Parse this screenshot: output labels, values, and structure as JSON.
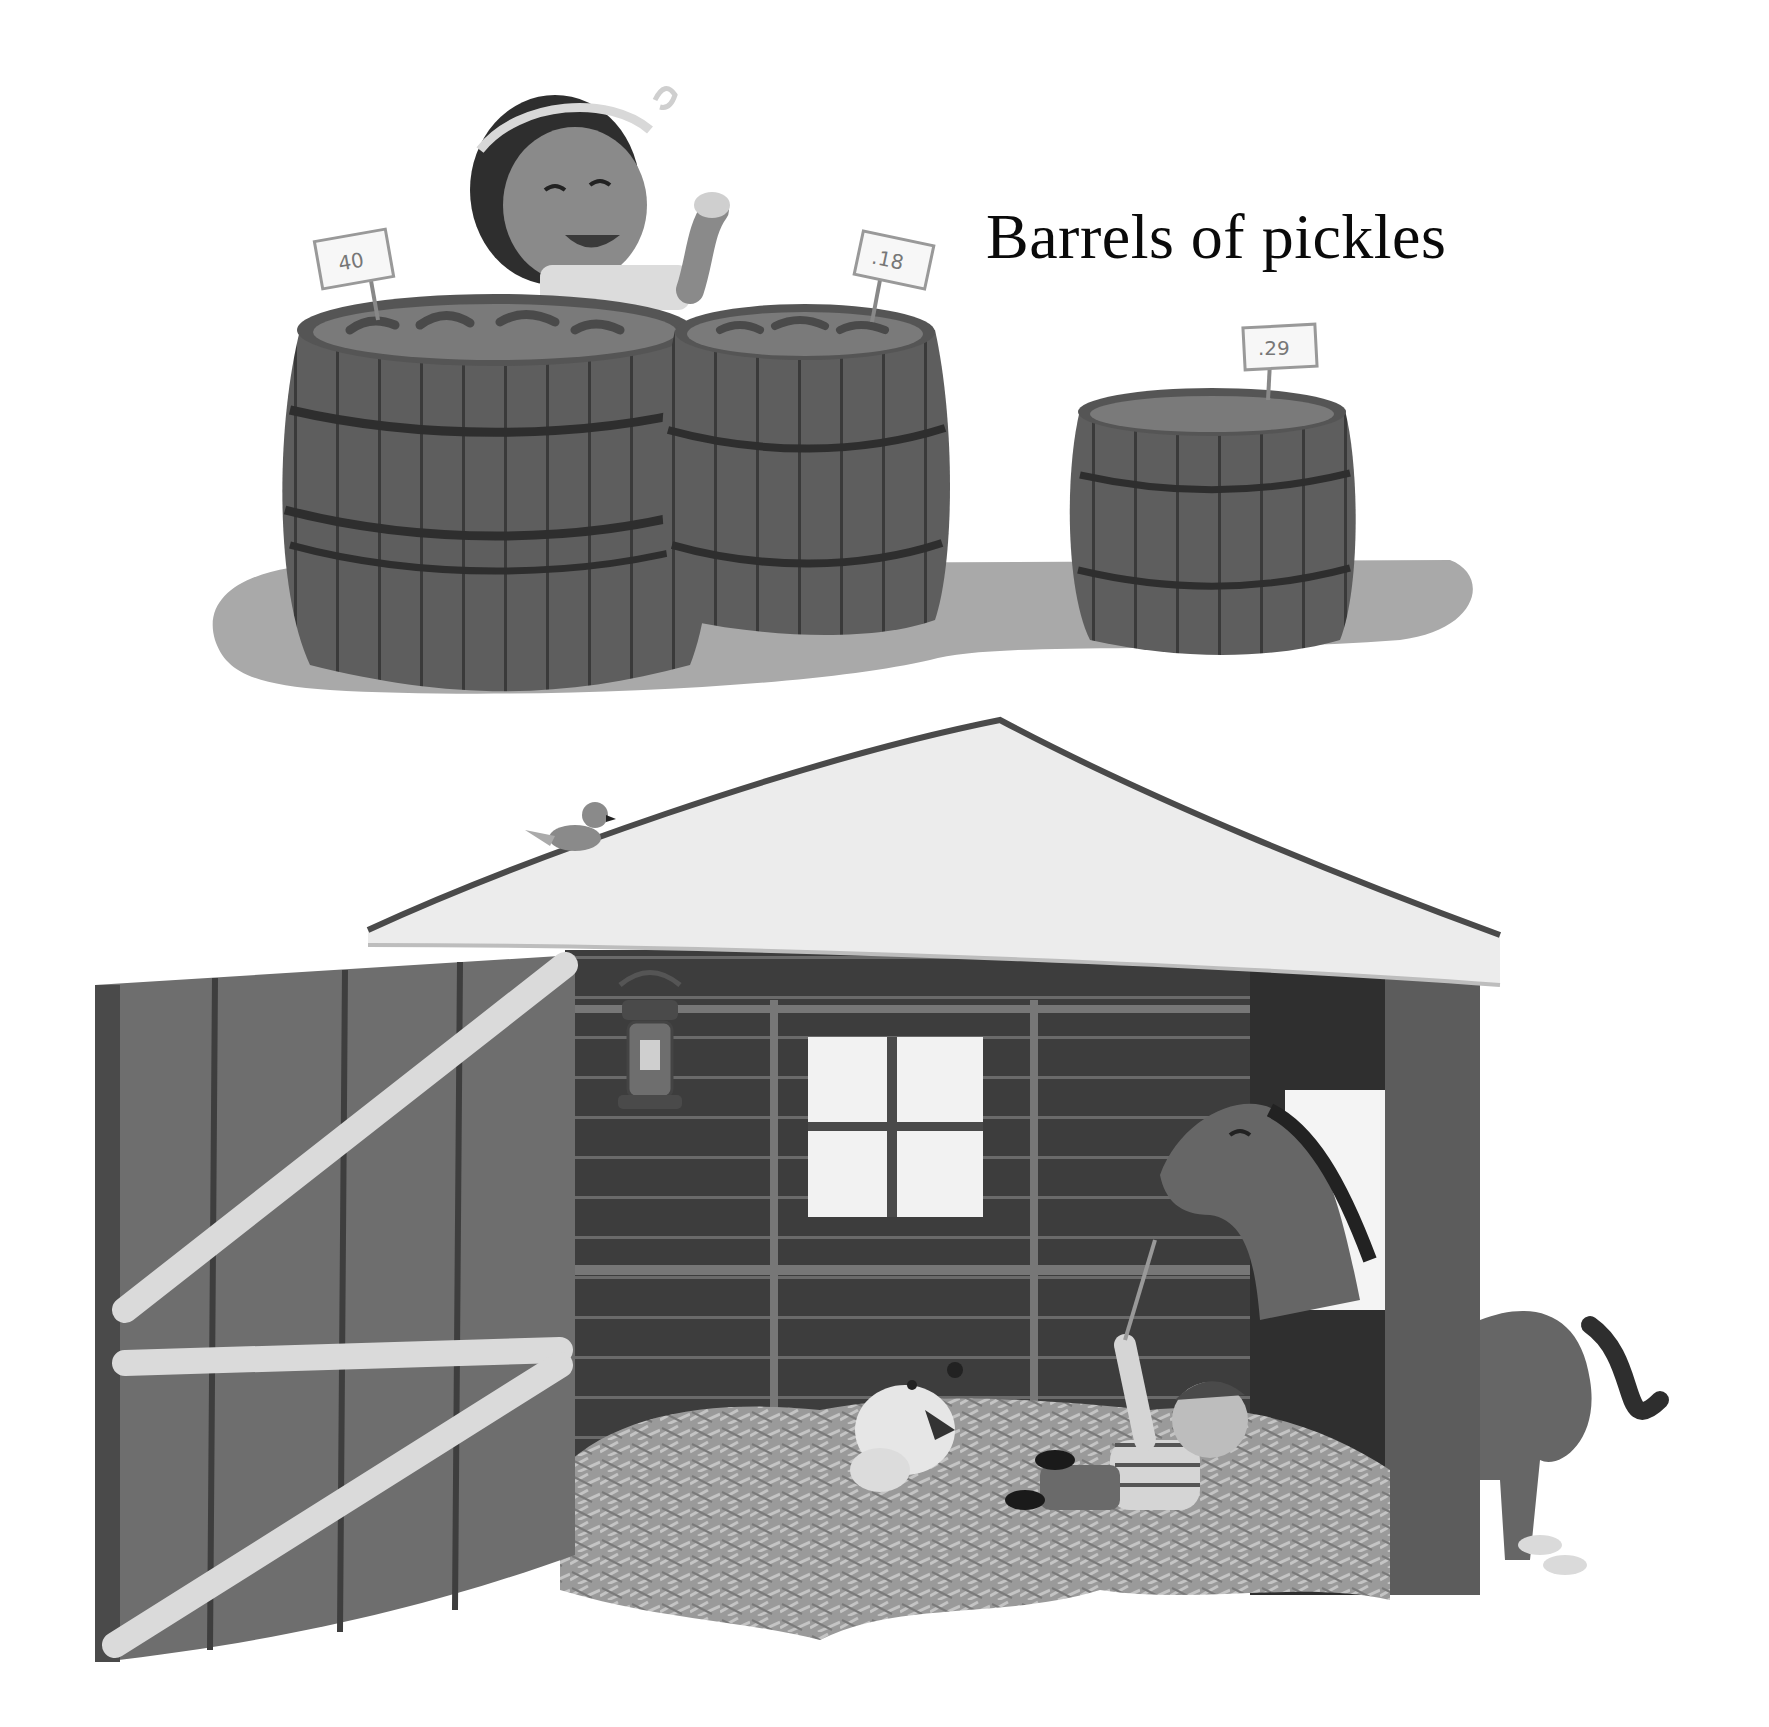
{
  "page": {
    "type": "picture-book-spread",
    "palette": {
      "background": "#ffffff",
      "text": "#0a0a0a",
      "barrel": "#5e5e5e",
      "barrel_dark": "#3a3a3a",
      "shadow": "#a9a9a9",
      "roof": "#ececec",
      "roof_edge": "#4a4a4a",
      "door": "#6e6e6e",
      "door_brace": "#dadada",
      "barn_wall": "#3d3d3d",
      "window": "#f2f2f2",
      "horse": "#666666",
      "straw": "#9a9a9a"
    }
  },
  "top_scene": {
    "caption": "Barrels of pickles",
    "price_tags": [
      {
        "label": "40",
        "barrel": "left"
      },
      {
        "label": ".18",
        "barrel": "middle"
      },
      {
        "label": ".29",
        "barrel": "right"
      }
    ],
    "characters": [
      "girl-with-headband-eating-pickle"
    ]
  },
  "bottom_scene": {
    "caption": "Straw that tickles",
    "elements": [
      "barn-roof",
      "bird-on-roof",
      "open-barn-door",
      "lantern",
      "window",
      "horse-in-stall",
      "dog-in-straw",
      "boy-in-straw",
      "straw-pile"
    ]
  }
}
